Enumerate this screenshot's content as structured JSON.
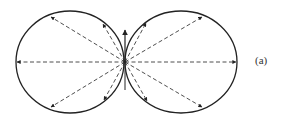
{
  "figure": {
    "label": "(a)",
    "stroke_color": "#222222",
    "origin": {
      "x": 125,
      "y": 62
    },
    "lobes": [
      {
        "name": "left-lobe",
        "cx": 70,
        "cy": 62,
        "rx": 54,
        "ry": 51
      },
      {
        "name": "right-lobe",
        "cx": 181,
        "cy": 62,
        "rx": 56,
        "ry": 51
      }
    ],
    "vectors": [
      {
        "to": [
          17,
          62
        ]
      },
      {
        "to": [
          51,
          17
        ]
      },
      {
        "to": [
          51,
          107
        ]
      },
      {
        "to": [
          103,
          24
        ]
      },
      {
        "to": [
          104,
          100
        ]
      },
      {
        "to": [
          236,
          62
        ]
      },
      {
        "to": [
          202,
          17
        ]
      },
      {
        "to": [
          202,
          107
        ]
      },
      {
        "to": [
          146,
          23
        ]
      },
      {
        "to": [
          147,
          101
        ]
      },
      {
        "to": [
          125,
          30
        ],
        "solid": true
      }
    ]
  }
}
